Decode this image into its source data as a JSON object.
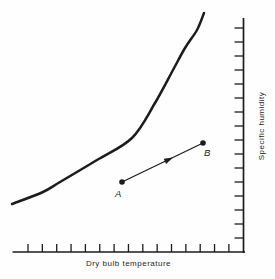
{
  "figure": {
    "background": "#fefefe",
    "ink": "#1c1c1c"
  },
  "chart_data": {
    "type": "line",
    "title": "",
    "xlabel": "Dry bulb temperature",
    "ylabel": "Specific humidity",
    "legend": "none",
    "grid": false,
    "x_axis": {
      "label": "Dry bulb temperature",
      "orientation": "bottom",
      "tick_count": 15,
      "has_numeric_labels": false,
      "line_px": {
        "x1": 12.5,
        "x2": 245,
        "y": 252
      },
      "tick_start_px": 28,
      "tick_step_px": 14.35,
      "tick_len_px": 8
    },
    "y_axis": {
      "label": "Specific humidity",
      "orientation": "right",
      "reading_direction": "bottom-to-top",
      "tick_count": 16,
      "has_numeric_labels": false,
      "line_px": {
        "x": 243.5,
        "y1": 18,
        "y2": 253
      },
      "tick_start_px": 28,
      "tick_step_px": 14,
      "tick_len_px": 9
    },
    "series": [
      {
        "name": "saturation curve",
        "style": "thick smooth exponential curve",
        "stroke_width_px": 2.5,
        "points_px": [
          [
            12,
            204
          ],
          [
            43,
            192
          ],
          [
            60,
            182
          ],
          [
            97,
            160
          ],
          [
            132,
            138
          ],
          [
            155,
            103
          ],
          [
            173,
            70
          ],
          [
            185,
            48
          ],
          [
            197,
            30
          ],
          [
            204,
            13
          ]
        ]
      },
      {
        "name": "process line A to B",
        "style": "thin straight line with midpoint arrowhead and dot endpoints",
        "stroke_width_px": 1.3,
        "points_px": [
          [
            122,
            182
          ],
          [
            203,
            143
          ]
        ],
        "arrow_tip_t": 0.63,
        "arrow_len_px": 9,
        "arrow_halfwidth_px": 2.8,
        "endpoint_dot_radius_px": 2.8
      }
    ],
    "points": [
      {
        "label": "A",
        "px": [
          122,
          182
        ]
      },
      {
        "label": "B",
        "px": [
          203,
          143
        ]
      }
    ]
  }
}
